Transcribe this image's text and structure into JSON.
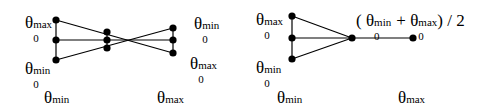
{
  "diagrams": [
    {
      "id": "left",
      "labels": {
        "top_left": {
          "symbol": "θ",
          "sub": "0",
          "sup": "max"
        },
        "bottom_left": {
          "symbol": "θ",
          "sub": "0",
          "sup": "min"
        },
        "top_right": {
          "symbol": "θ",
          "sub": "0",
          "sup": "min"
        },
        "bottom_right": {
          "symbol": "θ",
          "sub": "0",
          "sup": "max"
        },
        "axis_left": {
          "symbol": "θ",
          "sub": "1",
          "sup": "min"
        },
        "axis_right": {
          "symbol": "θ",
          "sub": "1",
          "sup": "max"
        }
      },
      "nodes": [
        {
          "x": 56,
          "y": 20
        },
        {
          "x": 56,
          "y": 40
        },
        {
          "x": 56,
          "y": 60
        },
        {
          "x": 107,
          "y": 32
        },
        {
          "x": 107,
          "y": 40
        },
        {
          "x": 107,
          "y": 48
        },
        {
          "x": 173,
          "y": 28
        },
        {
          "x": 173,
          "y": 40
        },
        {
          "x": 173,
          "y": 53
        }
      ]
    },
    {
      "id": "right",
      "labels": {
        "top_left": {
          "symbol": "θ",
          "sub": "0",
          "sup": "max"
        },
        "bottom_left": {
          "symbol": "θ",
          "sub": "0",
          "sup": "min"
        },
        "axis_left": {
          "symbol": "θ",
          "sub": "1",
          "sup": "min"
        },
        "axis_right": {
          "symbol": "θ",
          "sub": "1",
          "sup": "max"
        },
        "formula": {
          "open": "(",
          "term1": {
            "symbol": "θ",
            "sub": "0",
            "sup": "min"
          },
          "plus": "+",
          "term2": {
            "symbol": "θ",
            "sub": "0",
            "sup": "max"
          },
          "close": ") / 2"
        }
      },
      "nodes": [
        {
          "x": 292,
          "y": 16
        },
        {
          "x": 292,
          "y": 38
        },
        {
          "x": 292,
          "y": 59
        },
        {
          "x": 352,
          "y": 38
        },
        {
          "x": 413,
          "y": 38
        }
      ]
    }
  ]
}
